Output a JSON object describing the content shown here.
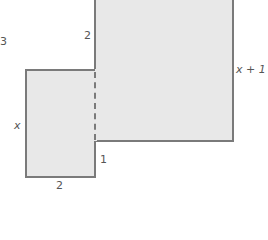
{
  "diagram": {
    "type": "composite-rectangles",
    "labels": {
      "corner": "3",
      "big_top_left": "2",
      "big_right": "x + 1",
      "small_left": "x",
      "small_bottom": "2",
      "step": "1"
    },
    "colors": {
      "fill": "#e8e8e8",
      "stroke": "#7a7a7a",
      "text": "#555555"
    }
  }
}
